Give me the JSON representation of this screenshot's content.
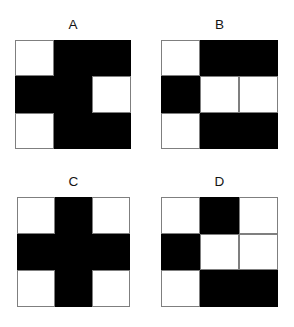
{
  "figure_set": {
    "background_color": "#ffffff",
    "cell_colors": {
      "black": "#000000",
      "white": "#ffffff",
      "border": "#7f7f7f"
    },
    "rows": 3,
    "columns": 3,
    "panels": [
      {
        "id": "a",
        "label": "A",
        "grid": [
          [
            "white",
            "black",
            "black"
          ],
          [
            "black",
            "black",
            "white"
          ],
          [
            "white",
            "black",
            "black"
          ]
        ]
      },
      {
        "id": "b",
        "label": "B",
        "grid": [
          [
            "white",
            "black",
            "black"
          ],
          [
            "black",
            "white",
            "white"
          ],
          [
            "white",
            "black",
            "black"
          ]
        ]
      },
      {
        "id": "c",
        "label": "C",
        "grid": [
          [
            "white",
            "black",
            "white"
          ],
          [
            "black",
            "black",
            "black"
          ],
          [
            "white",
            "black",
            "white"
          ]
        ]
      },
      {
        "id": "d",
        "label": "D",
        "grid": [
          [
            "white",
            "black",
            "white"
          ],
          [
            "black",
            "white",
            "white"
          ],
          [
            "white",
            "black",
            "black"
          ]
        ]
      }
    ]
  }
}
